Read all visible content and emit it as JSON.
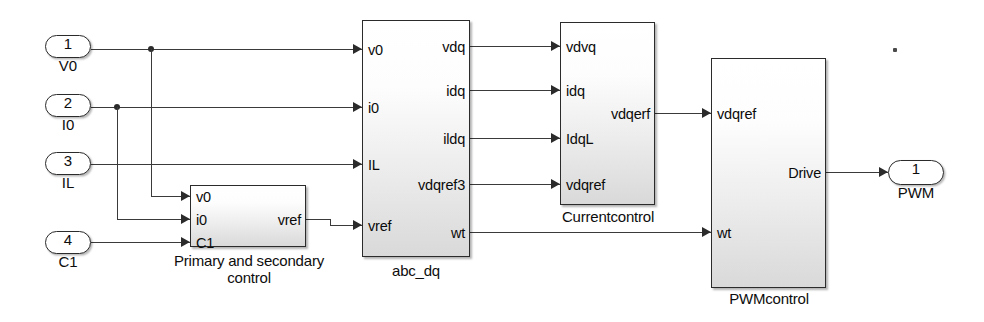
{
  "diagram": {
    "background": "#ffffff",
    "line_color": "#3a3a3a"
  },
  "input_ports": [
    {
      "number": "1",
      "name": "V0",
      "x": 45,
      "y": 35
    },
    {
      "number": "2",
      "name": "I0",
      "x": 45,
      "y": 94
    },
    {
      "number": "3",
      "name": "IL",
      "x": 45,
      "y": 152
    },
    {
      "number": "4",
      "name": "C1",
      "x": 45,
      "y": 239
    }
  ],
  "output_ports": [
    {
      "number": "1",
      "name": "PWM",
      "x": 888,
      "y": 160
    }
  ],
  "blocks": [
    {
      "id": "primary",
      "title": "Primary and secondary control",
      "x": 190,
      "y": 185,
      "w": 116,
      "h": 62,
      "inputs": [
        {
          "label": "v0",
          "y": 196
        },
        {
          "label": "i0",
          "y": 219
        },
        {
          "label": "C1",
          "y": 242
        }
      ],
      "outputs": [
        {
          "label": "vref",
          "y": 219
        }
      ]
    },
    {
      "id": "abc_dq",
      "title": "abc_dq",
      "x": 362,
      "y": 20,
      "w": 108,
      "h": 237,
      "inputs": [
        {
          "label": "v0",
          "y": 49
        },
        {
          "label": "i0",
          "y": 107
        },
        {
          "label": "IL",
          "y": 164
        },
        {
          "label": "vref",
          "y": 225
        }
      ],
      "outputs": [
        {
          "label": "vdq",
          "y": 46
        },
        {
          "label": "idq",
          "y": 90
        },
        {
          "label": "ildq",
          "y": 138
        },
        {
          "label": "vdqref3",
          "y": 184
        },
        {
          "label": "wt",
          "y": 232
        }
      ]
    },
    {
      "id": "currentcontrol",
      "title": "Currentcontrol",
      "x": 560,
      "y": 22,
      "w": 95,
      "h": 183,
      "inputs": [
        {
          "label": "vdvq",
          "y": 46
        },
        {
          "label": "idq",
          "y": 90
        },
        {
          "label": "IdqL",
          "y": 138
        },
        {
          "label": "vdqref",
          "y": 184
        }
      ],
      "outputs": [
        {
          "label": "vdqerf",
          "y": 113
        }
      ]
    },
    {
      "id": "pwmcontrol",
      "title": "PWMcontrol",
      "x": 711,
      "y": 58,
      "w": 115,
      "h": 230,
      "inputs": [
        {
          "label": "vdqref",
          "y": 113
        },
        {
          "label": "wt",
          "y": 232
        }
      ],
      "outputs": [
        {
          "label": "Drive",
          "y": 172
        }
      ]
    }
  ],
  "connections": [
    {
      "from": "V0",
      "to": "abc_dq.v0",
      "signal": "V0"
    },
    {
      "from": "V0",
      "to": "primary.v0",
      "signal": "V0"
    },
    {
      "from": "I0",
      "to": "abc_dq.i0",
      "signal": "I0"
    },
    {
      "from": "I0",
      "to": "primary.i0",
      "signal": "I0"
    },
    {
      "from": "IL",
      "to": "abc_dq.IL",
      "signal": "IL"
    },
    {
      "from": "C1",
      "to": "primary.C1",
      "signal": "C1"
    },
    {
      "from": "primary.vref",
      "to": "abc_dq.vref",
      "signal": "vref"
    },
    {
      "from": "abc_dq.vdq",
      "to": "currentcontrol.vdvq",
      "signal": "vdq"
    },
    {
      "from": "abc_dq.idq",
      "to": "currentcontrol.idq",
      "signal": "idq"
    },
    {
      "from": "abc_dq.ildq",
      "to": "currentcontrol.IdqL",
      "signal": "ildq"
    },
    {
      "from": "abc_dq.vdqref3",
      "to": "currentcontrol.vdqref",
      "signal": "vdqref3"
    },
    {
      "from": "abc_dq.wt",
      "to": "pwmcontrol.wt",
      "signal": "wt"
    },
    {
      "from": "currentcontrol.vdqerf",
      "to": "pwmcontrol.vdqref",
      "signal": "vdqerf"
    },
    {
      "from": "pwmcontrol.Drive",
      "to": "PWM",
      "signal": "Drive"
    }
  ]
}
